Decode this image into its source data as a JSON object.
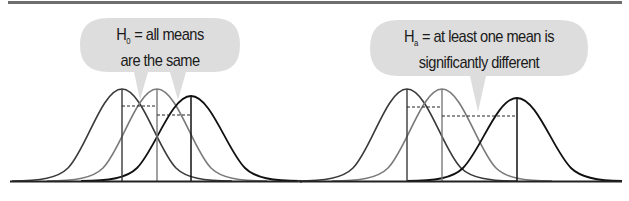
{
  "figure": {
    "top_rule_color": "#6e6e6e",
    "bubble_fill": "#d9d9d9",
    "curve_colors": {
      "first": "#3a3a3a",
      "second": "#7a7a7a",
      "third": "#111111"
    },
    "baseline_color": "#222222"
  },
  "panels": [
    {
      "id": "null-hypothesis",
      "bubble": {
        "symbol": "H",
        "subscript": "0",
        "line1_rest": " = all means",
        "line2": "are the same"
      },
      "means_x": [
        122,
        157,
        191
      ],
      "peak_y": [
        89,
        89,
        96
      ],
      "dashed_y": [
        106,
        115
      ]
    },
    {
      "id": "alternative-hypothesis",
      "bubble": {
        "symbol": "H",
        "subscript": "a",
        "line1_rest": " = at least one mean is",
        "line2": "significantly different"
      },
      "means_x": [
        407,
        442,
        517
      ],
      "peak_y": [
        89,
        89,
        98
      ],
      "dashed_y": [
        107,
        116
      ]
    }
  ]
}
